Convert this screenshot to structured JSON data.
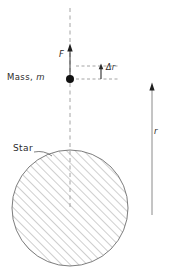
{
  "figure": {
    "labels": {
      "mass_prefix": "Mass,",
      "mass_symbol": "m",
      "force": "F",
      "delta_r": "Δr",
      "star": "Star",
      "radial_distance": "r"
    },
    "colors": {
      "ink": "#2b2b2b",
      "hatch": "#8c8c8c",
      "outline": "#6e6e6e",
      "dashed_axis": "#9a9a9a",
      "background": "#ffffff"
    },
    "geometry": {
      "width": 170,
      "height": 277,
      "axis_x": 70,
      "axis_top_y": 8,
      "axis_bottom_y": 208,
      "mass_point": [
        70,
        79
      ],
      "mass_dot_radius": 4,
      "force_arrow_from_y": 78,
      "force_arrow_to_y": 45,
      "delta_r_upper_guide_y": 66,
      "delta_r_lower_guide_y": 79,
      "delta_r_guide_x_end": 118,
      "star_center": [
        70,
        208
      ],
      "star_radius": 58,
      "r_arrow_x": 152,
      "r_arrow_top_y": 83,
      "r_arrow_bottom_y": 215,
      "hatch_angle_deg": 45,
      "hatch_spacing": 6
    }
  }
}
